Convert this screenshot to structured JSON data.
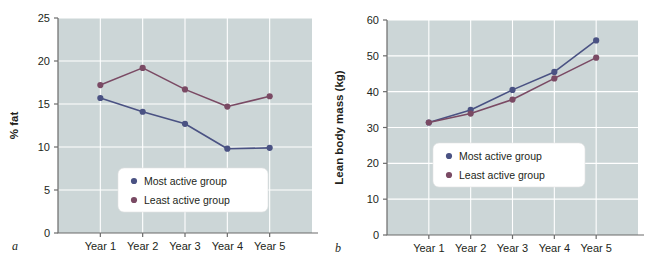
{
  "figure": {
    "panels": [
      {
        "letter": "a",
        "chart_data": {
          "type": "line",
          "title": "",
          "xlabel": "",
          "ylabel": "% fat",
          "categories": [
            "Year 1",
            "Year 2",
            "Year 3",
            "Year 4",
            "Year 5"
          ],
          "ylim": [
            0,
            25
          ],
          "yticks": [
            0,
            5,
            10,
            15,
            20,
            25
          ],
          "grid": true,
          "legend_position": "bottom-center",
          "series": [
            {
              "name": "Most active group",
              "color": "#4a5283",
              "values": [
                15.7,
                14.1,
                12.7,
                9.8,
                9.9
              ]
            },
            {
              "name": "Least active group",
              "color": "#7a4a64",
              "values": [
                17.2,
                19.2,
                16.7,
                14.7,
                15.9
              ]
            }
          ]
        }
      },
      {
        "letter": "b",
        "chart_data": {
          "type": "line",
          "title": "",
          "xlabel": "",
          "ylabel": "Lean body mass (kg)",
          "categories": [
            "Year 1",
            "Year 2",
            "Year 3",
            "Year 4",
            "Year 5"
          ],
          "ylim": [
            0,
            60
          ],
          "yticks": [
            0,
            10,
            20,
            30,
            40,
            50,
            60
          ],
          "grid": true,
          "legend_position": "middle-center",
          "series": [
            {
              "name": "Most active group",
              "color": "#4a5283",
              "values": [
                31.4,
                34.9,
                40.5,
                45.5,
                54.3
              ]
            },
            {
              "name": "Least active group",
              "color": "#7a4a64",
              "values": [
                31.4,
                33.9,
                37.8,
                43.7,
                49.5
              ]
            }
          ]
        }
      }
    ],
    "colors": {
      "plot_background": "#ccd6d7",
      "gridline": "#ffffff",
      "axis": "#6b6b6b",
      "page_background": "#ffffff"
    }
  }
}
